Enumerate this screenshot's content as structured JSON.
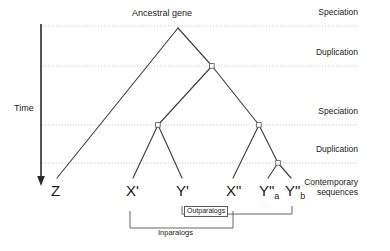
{
  "figure": {
    "type": "phylogenetic-gene-tree-diagram",
    "axis": {
      "label": "Time",
      "direction": "downward-arrow"
    },
    "root_label": "Ancestral gene",
    "event_rows": [
      {
        "id": "speciation-1",
        "label": "Speciation",
        "y": 26
      },
      {
        "id": "duplication-1",
        "label": "Duplication",
        "y": 66
      },
      {
        "id": "speciation-2",
        "label": "Speciation",
        "y": 125
      },
      {
        "id": "duplication-2",
        "label": "Duplication",
        "y": 163
      }
    ],
    "contemporary_label_line1": "Contemporary",
    "contemporary_label_line2": "sequences",
    "tips": [
      {
        "id": "tip-z",
        "label": "Z",
        "sub": "",
        "x": 57
      },
      {
        "id": "tip-x1",
        "label": "X'",
        "sub": "",
        "x": 133
      },
      {
        "id": "tip-y1",
        "label": "Y'",
        "sub": "",
        "x": 182
      },
      {
        "id": "tip-x2",
        "label": "X\"",
        "sub": "",
        "x": 233
      },
      {
        "id": "tip-y2a",
        "label": "Y\"",
        "sub": "a",
        "x": 267
      },
      {
        "id": "tip-y2b",
        "label": "Y\"",
        "sub": "b",
        "x": 292
      }
    ],
    "brackets": {
      "outparalogs": "Outparalogs",
      "inparalogs": "Inparalogs"
    },
    "colors": {
      "branch": "#404040",
      "gridline": "#c8c8c8",
      "text": "#1a1a1a",
      "node_fill": "#ffffff",
      "node_stroke": "#555555",
      "bracket": "#555555"
    }
  }
}
